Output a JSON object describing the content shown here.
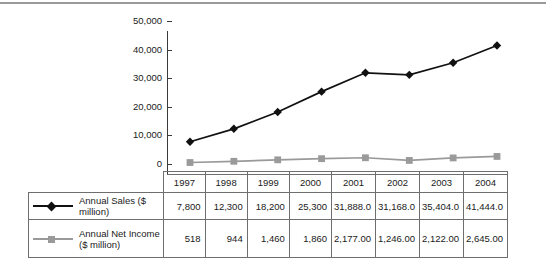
{
  "chart_data": {
    "type": "line",
    "title": "",
    "subtitle": "",
    "xlabel": "",
    "ylabel": "",
    "categories": [
      "1997",
      "1998",
      "1999",
      "2000",
      "2001",
      "2002",
      "2003",
      "2004"
    ],
    "ylim": [
      0,
      50000
    ],
    "ytick_values": [
      0,
      10000,
      20000,
      30000,
      40000,
      50000
    ],
    "ytick_labels": [
      "0",
      "10,000",
      "20,000",
      "30,000",
      "40,000",
      "50,000"
    ],
    "grid": false,
    "legend_position": "table-left",
    "series": [
      {
        "name": "Annual Sales ($ million)",
        "marker": "diamond",
        "color": "#111111",
        "values": [
          7800,
          12300,
          18200,
          25300,
          31888.0,
          31168.0,
          35404.0,
          41444.0
        ],
        "labels": [
          "7,800",
          "12,300",
          "18,200",
          "25,300",
          "31,888.0",
          "31,168.0",
          "35,404.0",
          "41,444.0"
        ]
      },
      {
        "name": "Annual Net Income ($ million)",
        "marker": "square",
        "color": "#9a9a9a",
        "values": [
          518,
          944,
          1460,
          1860,
          2177.0,
          1246.0,
          2122.0,
          2645.0
        ],
        "labels": [
          "518",
          "944",
          "1,460",
          "1,860",
          "2,177.00",
          "1,246.00",
          "2,122.00",
          "2,645.00"
        ]
      }
    ]
  },
  "table": {
    "corner_label": "",
    "header": [
      "1997",
      "1998",
      "1999",
      "2000",
      "2001",
      "2002",
      "2003",
      "2004"
    ],
    "rows": [
      {
        "legend_label": "Annual Sales ($ million)",
        "legend_label_line1": "Annual Sales ($ million)",
        "legend_label_line2": "",
        "marker": "diamond",
        "values": [
          "7,800",
          "12,300",
          "18,200",
          "25,300",
          "31,888.0",
          "31,168.0",
          "35,404.0",
          "41,444.0"
        ]
      },
      {
        "legend_label": "Annual Net Income ($ million)",
        "legend_label_line1": "Annual Net Income",
        "legend_label_line2": "($ million)",
        "marker": "square",
        "values": [
          "518",
          "944",
          "1,460",
          "1,860",
          "2,177.00",
          "1,246.00",
          "2,122.00",
          "2,645.00"
        ]
      }
    ]
  },
  "colors": {
    "series_sales": "#111111",
    "series_income": "#9a9a9a",
    "axis": "#3a3a3a",
    "table_border": "#6e6e6e",
    "top_rule": "#9a9a9a",
    "background": "#ffffff"
  }
}
